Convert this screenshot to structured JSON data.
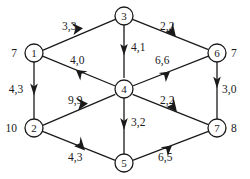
{
  "figure": {
    "type": "directed-flow-network",
    "width": 250,
    "height": 179,
    "background_color": "#ffffff",
    "ink_color": "#1a1a1a"
  },
  "nodes": [
    {
      "id": "1",
      "label": "1",
      "cx": 34,
      "cy": 53,
      "r": 9
    },
    {
      "id": "2",
      "label": "2",
      "cx": 34,
      "cy": 128,
      "r": 9
    },
    {
      "id": "3",
      "label": "3",
      "cx": 124,
      "cy": 16,
      "r": 9
    },
    {
      "id": "4",
      "label": "4",
      "cx": 124,
      "cy": 89,
      "r": 9
    },
    {
      "id": "5",
      "label": "5",
      "cx": 124,
      "cy": 163,
      "r": 9
    },
    {
      "id": "6",
      "label": "6",
      "cx": 217,
      "cy": 53,
      "r": 9
    },
    {
      "id": "7",
      "label": "7",
      "cx": 217,
      "cy": 128,
      "r": 9
    }
  ],
  "node_side_labels": [
    {
      "for_node": "1",
      "text": "7",
      "x": 17,
      "y": 53,
      "anchor": "end"
    },
    {
      "for_node": "2",
      "text": "10",
      "x": 17,
      "y": 128,
      "anchor": "end"
    },
    {
      "for_node": "6",
      "text": "7",
      "x": 231,
      "y": 53,
      "anchor": "start"
    },
    {
      "for_node": "7",
      "text": "8",
      "x": 231,
      "y": 128,
      "anchor": "start"
    }
  ],
  "edges": [
    {
      "id": "e1-3",
      "from": "1",
      "to": "3",
      "label": "3,3",
      "label_x": 62,
      "label_y": 26,
      "anchor": "start"
    },
    {
      "id": "e3-6",
      "from": "3",
      "to": "6",
      "label": "2,2",
      "label_x": 160,
      "label_y": 26,
      "anchor": "start"
    },
    {
      "id": "e3-4",
      "from": "3",
      "to": "4",
      "label": "4,1",
      "label_x": 131,
      "label_y": 47,
      "anchor": "start"
    },
    {
      "id": "e4-1",
      "from": "4",
      "to": "1",
      "label": "4,0",
      "label_x": 70,
      "label_y": 60,
      "anchor": "start"
    },
    {
      "id": "e4-6",
      "from": "4",
      "to": "6",
      "label": "6,6",
      "label_x": 155,
      "label_y": 60,
      "anchor": "start"
    },
    {
      "id": "e1-2",
      "from": "1",
      "to": "2",
      "label": "4,3",
      "label_x": 16,
      "label_y": 89,
      "anchor": "middle"
    },
    {
      "id": "e2-4",
      "from": "2",
      "to": "4",
      "label": "9,9",
      "label_x": 68,
      "label_y": 100,
      "anchor": "start"
    },
    {
      "id": "e6-7",
      "from": "6",
      "to": "7",
      "label": "3,0",
      "label_x": 222,
      "label_y": 89,
      "anchor": "start"
    },
    {
      "id": "e4-7",
      "from": "4",
      "to": "7",
      "label": "2,2",
      "label_x": 160,
      "label_y": 100,
      "anchor": "start"
    },
    {
      "id": "e4-5",
      "from": "4",
      "to": "5",
      "label": "3,2",
      "label_x": 131,
      "label_y": 122,
      "anchor": "start"
    },
    {
      "id": "e2-5",
      "from": "2",
      "to": "5",
      "label": "4,3",
      "label_x": 68,
      "label_y": 157,
      "anchor": "start"
    },
    {
      "id": "e5-7",
      "from": "5",
      "to": "7",
      "label": "6,5",
      "label_x": 158,
      "label_y": 157,
      "anchor": "start"
    }
  ]
}
